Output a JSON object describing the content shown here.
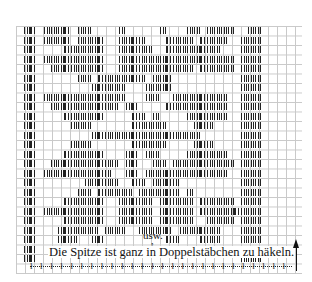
{
  "chart": {
    "cols": 32,
    "cell_w": 9,
    "cell_h": 9.5,
    "rows": [
      "0110111101100001000001000110111100110",
      "0110111101111001111000111101111001110",
      "0110000111111001111100111111110001110",
      "0110111111111001111111111111111101110",
      "0110011111111001111111111101111101110",
      "0110000001101111111011100000000001110",
      "0110000000011111000111100000000001110",
      "0110111111111111000110011111111001110",
      "0110011111111110110000111111111001110",
      "0110000111111000011010000111111001110",
      "0110000011100000011111000011100001110",
      "0110000000011111111111111110000001110",
      "0110000011100000011111000011100001110",
      "0110000111111000110110000111111001110",
      "0110011111111110110011011111111101110",
      "0110111111111100110111111111111001110",
      "0110000000111110011011110000000001110",
      "0110000001101111101111110100000001110",
      "0110000111111001111101111101111101110",
      "0110111111111001111101111101111111110",
      "0110000111111001111101111100111101110",
      "0110001111110111001111101111110001110",
      "0110001110011000000000110001110001110",
      "0110000000000000000000000000000001110",
      "0110000000000000000000000000000001110"
    ]
  },
  "annotations": {
    "usw": "usw.",
    "usw_arrow": "↑",
    "caption": "Die Spitze ist ganz in Doppelstäbchen zu häkeln.",
    "border_stitch": "ł",
    "border_stitch_count": 26,
    "row_direction_arrow": "up-arrow"
  }
}
